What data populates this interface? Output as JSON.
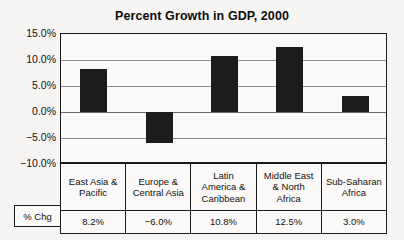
{
  "chart_data": {
    "type": "bar",
    "title": "Percent Growth in GDP, 2000",
    "xlabel": "",
    "ylabel": "",
    "ylim": [
      -10,
      15
    ],
    "grid": true,
    "legend": "none",
    "categories": [
      "East Asia & Pacific",
      "Europe & Central Asia",
      "Latin America & Caribbean",
      "Middle East & North Africa",
      "Sub-Saharan Africa"
    ],
    "values": [
      8.2,
      -6.0,
      10.8,
      12.5,
      3.0
    ],
    "ytick_labels": [
      "15.0%",
      "10.0%",
      "5.0%",
      "0.0%",
      "−5.0%",
      "−10.0%"
    ],
    "ytick_values": [
      15,
      10,
      5,
      0,
      -5,
      -10
    ],
    "bar_color": "#1c1c1c"
  },
  "table": {
    "row_label": "% Chg",
    "headers": [
      [
        "East Asia &",
        "Pacific"
      ],
      [
        "Europe &",
        "Central Asia"
      ],
      [
        "Latin",
        "America &",
        "Caribbean"
      ],
      [
        "Middle East",
        "& North",
        "Africa"
      ],
      [
        "Sub-Saharan",
        "Africa"
      ]
    ],
    "values": [
      "8.2%",
      "−6.0%",
      "10.8%",
      "12.5%",
      "3.0%"
    ]
  }
}
